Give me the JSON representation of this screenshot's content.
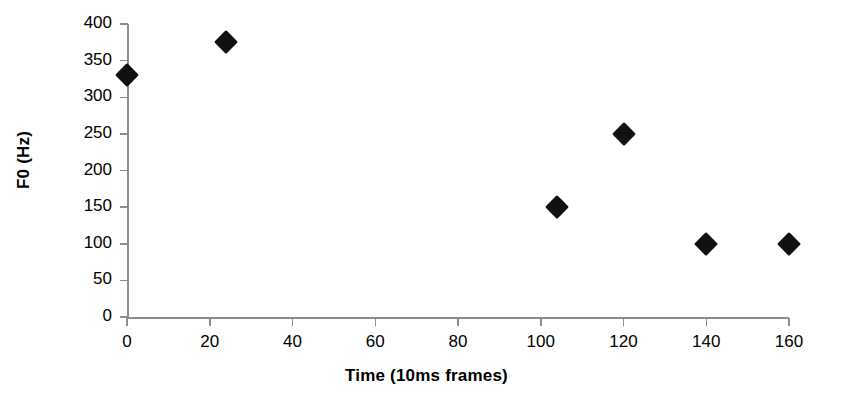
{
  "chart_data": {
    "type": "scatter",
    "title": "",
    "xlabel": "Time (10ms frames)",
    "ylabel": "F0 (Hz)",
    "xlim": [
      0,
      160
    ],
    "ylim": [
      0,
      400
    ],
    "xticks": [
      0,
      20,
      40,
      60,
      80,
      100,
      120,
      140,
      160
    ],
    "xtick_labels": [
      "0",
      "20",
      "40",
      "60",
      "80",
      "100",
      "120",
      "140",
      "160"
    ],
    "yticks": [
      0,
      50,
      100,
      150,
      200,
      250,
      300,
      350,
      400
    ],
    "ytick_labels": [
      "0",
      "50",
      "100",
      "150",
      "200",
      "250",
      "300",
      "350",
      "400"
    ],
    "grid": false,
    "legend": null,
    "marker": "diamond",
    "marker_color": "#111111",
    "axis_color": "#8c8c8c",
    "points": [
      {
        "x": 0,
        "y": 330
      },
      {
        "x": 24,
        "y": 375
      },
      {
        "x": 104,
        "y": 150
      },
      {
        "x": 120,
        "y": 250
      },
      {
        "x": 140,
        "y": 100
      },
      {
        "x": 160,
        "y": 100
      }
    ]
  }
}
